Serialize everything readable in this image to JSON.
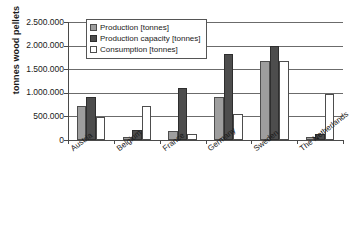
{
  "chart_data": {
    "type": "bar",
    "title": "",
    "xlabel": "",
    "ylabel": "tonnes wood pellets",
    "ylim": [
      0,
      2500000
    ],
    "ytick_labels": [
      "2.500.000",
      "2.000.000",
      "1.500.000",
      "1.000.000",
      "500.000",
      "0"
    ],
    "ytick_values": [
      2500000,
      2000000,
      1500000,
      1000000,
      500000,
      0
    ],
    "grid": true,
    "legend_position": "top-left-inside",
    "categories": [
      "Austria",
      "Belgium",
      "France",
      "Germany",
      "Sweden",
      "The Netherlands"
    ],
    "series": [
      {
        "name": "Production [tonnes]",
        "color": "#9e9e9e",
        "values": [
          730000,
          60000,
          190000,
          910000,
          1670000,
          70000
        ]
      },
      {
        "name": "Production capacity [tonnes]",
        "color": "#4d4d4d",
        "values": [
          910000,
          220000,
          1100000,
          1820000,
          2000000,
          120000
        ]
      },
      {
        "name": "Consumption [tonnes]",
        "color": "#ffffff",
        "values": [
          480000,
          730000,
          120000,
          560000,
          1670000,
          970000
        ]
      }
    ]
  },
  "legend": {
    "items": [
      {
        "label": "Production [tonnes]"
      },
      {
        "label": "Production capacity [tonnes]"
      },
      {
        "label": "Consumption [tonnes]"
      }
    ]
  }
}
